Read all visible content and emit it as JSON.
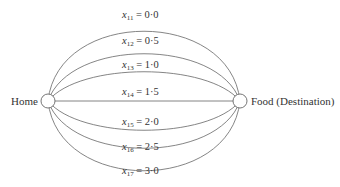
{
  "diagram": {
    "nodes": {
      "home": {
        "label": "Home"
      },
      "food": {
        "label": "Food (Destination)"
      }
    },
    "edges": [
      {
        "var": "x",
        "sub": "11",
        "eq": " = 0·0"
      },
      {
        "var": "x",
        "sub": "12",
        "eq": " = 0·5"
      },
      {
        "var": "x",
        "sub": "13",
        "eq": " = 1·0"
      },
      {
        "var": "x",
        "sub": "14",
        "eq": " = 1·5"
      },
      {
        "var": "x",
        "sub": "15",
        "eq": " = 2·0"
      },
      {
        "var": "x",
        "sub": "16",
        "eq": " = 2·5"
      },
      {
        "var": "x",
        "sub": "17",
        "eq": " = 3·0"
      }
    ]
  }
}
